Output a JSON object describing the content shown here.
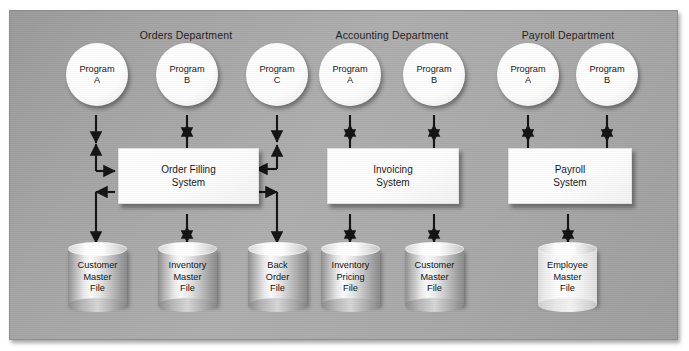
{
  "diagram": {
    "title_present": false,
    "departments": [
      {
        "id": "orders",
        "title": "Orders Department",
        "programs": [
          {
            "line1": "Program",
            "line2": "A"
          },
          {
            "line1": "Program",
            "line2": "B"
          },
          {
            "line1": "Program",
            "line2": "C"
          }
        ],
        "system": {
          "line1": "Order Filling",
          "line2": "System"
        },
        "files": [
          {
            "line1": "Customer",
            "line2": "Master",
            "line3": "File",
            "shade": "metallic"
          },
          {
            "line1": "Inventory",
            "line2": "Master",
            "line3": "File",
            "shade": "metallic"
          },
          {
            "line1": "Back",
            "line2": "Order",
            "line3": "File",
            "shade": "metallic"
          }
        ]
      },
      {
        "id": "accounting",
        "title": "Accounting Department",
        "programs": [
          {
            "line1": "Program",
            "line2": "A"
          },
          {
            "line1": "Program",
            "line2": "B"
          }
        ],
        "system": {
          "line1": "Invoicing",
          "line2": "System"
        },
        "files": [
          {
            "line1": "Inventory",
            "line2": "Pricing",
            "line3": "File",
            "shade": "metallic"
          },
          {
            "line1": "Customer",
            "line2": "Master",
            "line3": "File",
            "shade": "metallic"
          }
        ]
      },
      {
        "id": "payroll",
        "title": "Payroll Department",
        "programs": [
          {
            "line1": "Program",
            "line2": "A"
          },
          {
            "line1": "Program",
            "line2": "B"
          }
        ],
        "system": {
          "line1": "Payroll",
          "line2": "System"
        },
        "files": [
          {
            "line1": "Employee",
            "line2": "Master",
            "line3": "File",
            "shade": "light"
          }
        ]
      }
    ],
    "colors": {
      "background": "#a6a6a6",
      "node_fill": "#ffffff",
      "arrow": "#111111",
      "text": "#161616",
      "frame_border": "#8d8d8d"
    }
  }
}
